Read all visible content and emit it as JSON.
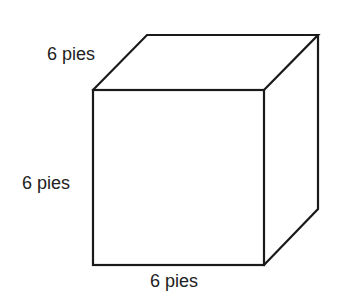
{
  "diagram": {
    "type": "cube",
    "labels": {
      "depth": "6 pies",
      "height": "6 pies",
      "width": "6 pies"
    },
    "colors": {
      "line": "#1a1a1a",
      "text": "#222222",
      "background": "#ffffff"
    }
  }
}
